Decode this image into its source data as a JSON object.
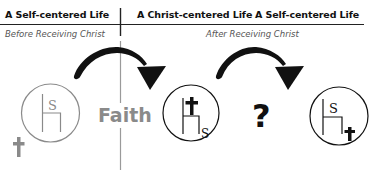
{
  "headers": {
    "left": "A Self-centered Life",
    "middle": "A Christ-centered Life",
    "right": "A Self-centered Life"
  },
  "subheaders": {
    "left": "Before Receiving Christ",
    "right": "After Receiving Christ"
  },
  "labels": {
    "faith": "Faith",
    "question": "?"
  },
  "diagrams": [
    {
      "name": "self-centered-before",
      "throne_letter": "S",
      "cross_position": "outside-bottom-left",
      "color": "#8a8a8a"
    },
    {
      "name": "christ-centered",
      "throne_letter": "S",
      "cross_position": "on-throne",
      "color": "#111111"
    },
    {
      "name": "self-centered-after",
      "throne_letter": "S",
      "cross_position": "bottom-right-inside",
      "color": "#111111"
    }
  ],
  "colors": {
    "ink": "#111111",
    "gray": "#8a8a8a",
    "background": "#ffffff"
  }
}
